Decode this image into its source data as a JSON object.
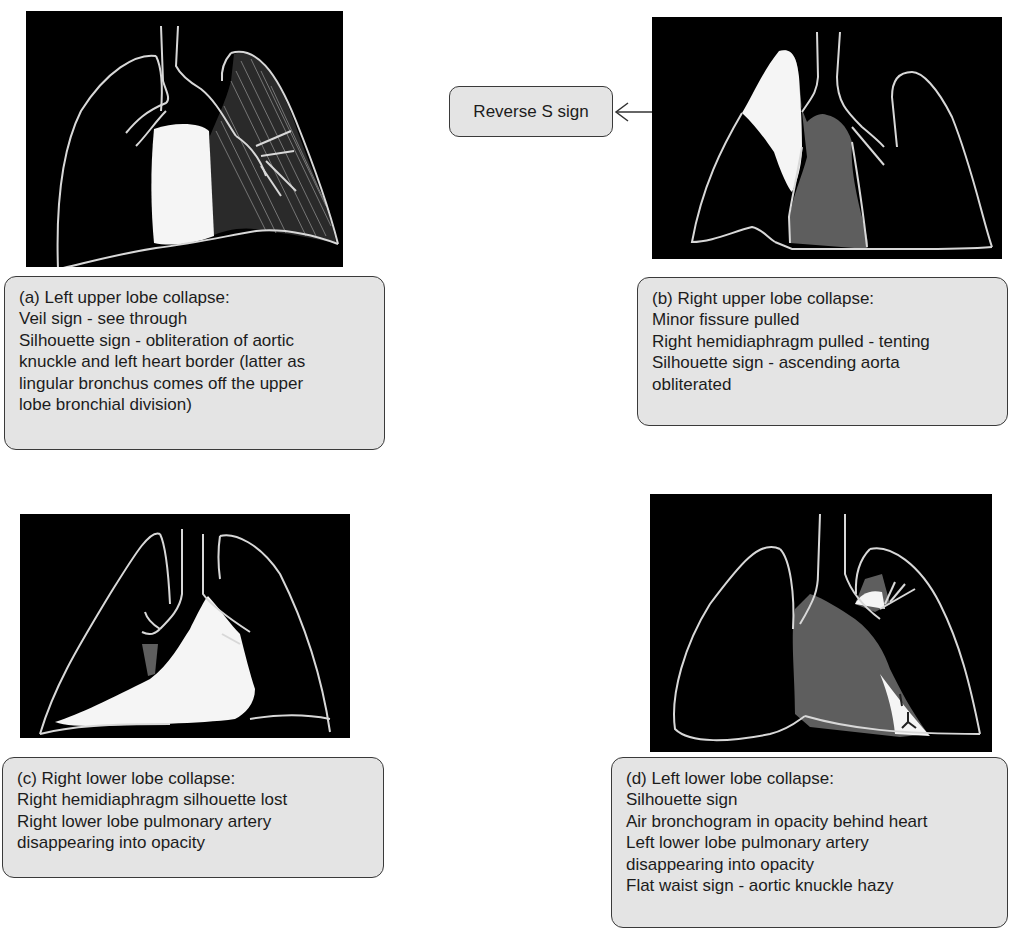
{
  "panels": {
    "a": {
      "title": "(a) Left upper lobe collapse:",
      "lines": [
        "Veil sign - see through",
        "Silhouette sign - obliteration of aortic",
        "knuckle and left heart border (latter as",
        "lingular bronchus comes off the upper",
        "lobe bronchial division)"
      ],
      "image_label": "left-upper-lobe-collapse-xray"
    },
    "b": {
      "title": "(b) Right upper lobe collapse:",
      "lines": [
        "Minor fissure pulled",
        "Right hemidiaphragm pulled - tenting",
        "Silhouette sign - ascending aorta",
        "obliterated"
      ],
      "callout": "Reverse S sign",
      "image_label": "right-upper-lobe-collapse-xray"
    },
    "c": {
      "title": "(c) Right lower lobe collapse:",
      "lines": [
        "Right hemidiaphragm silhouette lost",
        "Right lower lobe pulmonary artery",
        "disappearing into opacity"
      ],
      "image_label": "right-lower-lobe-collapse-xray"
    },
    "d": {
      "title": "(d) Left lower lobe collapse:",
      "lines": [
        "Silhouette sign",
        "Air bronchogram in opacity behind heart",
        "Left lower lobe pulmonary artery",
        "disappearing into opacity",
        "Flat waist sign - aortic knuckle hazy"
      ],
      "image_label": "left-lower-lobe-collapse-xray"
    }
  },
  "colors": {
    "background": "#ffffff",
    "xray_bg": "#000000",
    "outline": "#d8d8d8",
    "opacity_white": "#f5f5f5",
    "opacity_grey": "#5e5e5e",
    "caption_bg": "#e4e4e4",
    "caption_border": "#3a3a3a"
  }
}
